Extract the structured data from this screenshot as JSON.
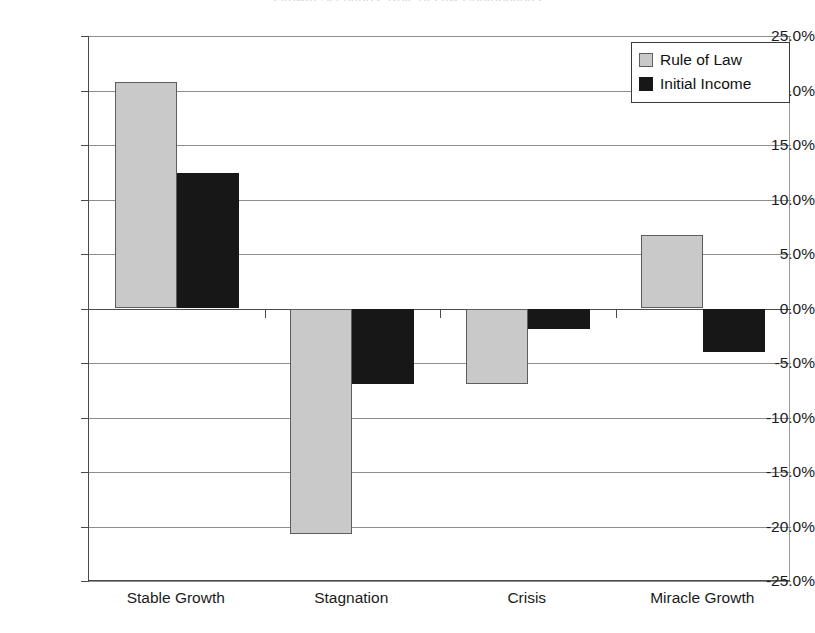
{
  "chart_data": {
    "type": "bar",
    "title": "Growth Scenarios: Rule of Law Contributions",
    "subtitle": "",
    "xlabel": "",
    "ylabel": "",
    "categories": [
      "Stable Growth",
      "Stagnation",
      "Crisis",
      "Miracle Growth"
    ],
    "series": [
      {
        "name": "Rule of Law",
        "color": "#c9c9c9",
        "values": [
          20.8,
          -20.7,
          -6.9,
          6.7
        ]
      },
      {
        "name": "Initial Income",
        "color": "#171717",
        "values": [
          12.4,
          -6.9,
          -1.9,
          -4.0
        ]
      }
    ],
    "value_unit": "%",
    "ylim": [
      -25.0,
      25.0
    ],
    "ytick_values": [
      25.0,
      20.0,
      15.0,
      10.0,
      5.0,
      0.0,
      -5.0,
      -10.0,
      -15.0,
      -20.0,
      -25.0
    ],
    "ytick_labels": [
      "25.0%",
      "20.0%",
      "15.0%",
      "10.0%",
      "5.0%",
      "0.0%",
      "-5.0%",
      "-10.0%",
      "-15.0%",
      "-20.0%",
      "-25.0%"
    ],
    "grid": true,
    "grid_axis": "y",
    "legend": {
      "position": "top-right",
      "entries": [
        "Rule of Law",
        "Initial Income"
      ]
    },
    "zero_line": 0.0
  }
}
